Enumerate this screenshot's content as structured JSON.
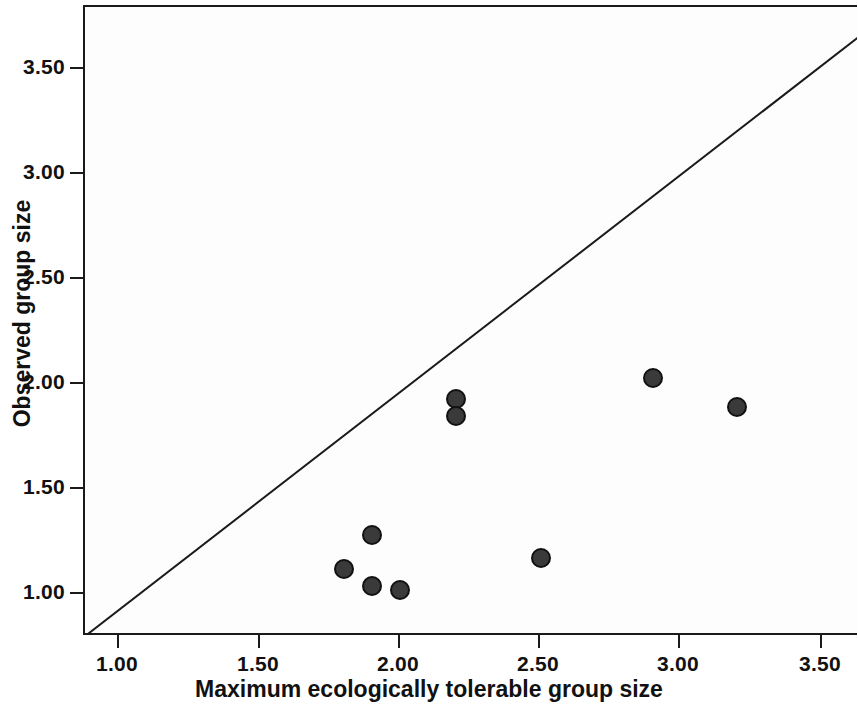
{
  "figure": {
    "background_color": "#ffffff",
    "plot_background_color": "#fdfdfd",
    "axis_color": "#1a1a1a",
    "marker_color": "#3a3a3a",
    "marker_edge_color": "#111111"
  },
  "chart_data": {
    "type": "scatter",
    "title": "",
    "xlabel": "Maximum ecologically tolerable group size",
    "ylabel": "Observed group size",
    "xlim": [
      0.88,
      3.63
    ],
    "ylim": [
      0.8,
      3.65
    ],
    "xticks": [
      1.0,
      1.5,
      2.0,
      2.5,
      3.0,
      3.5
    ],
    "xtick_labels": [
      "1.00",
      "1.50",
      "2.00",
      "2.50",
      "3.00",
      "3.50"
    ],
    "yticks": [
      1.0,
      1.5,
      2.0,
      2.5,
      3.0,
      3.5
    ],
    "ytick_labels": [
      "1.00",
      "1.50",
      "2.00",
      "2.50",
      "3.00",
      "3.50"
    ],
    "grid": false,
    "legend": null,
    "series": [
      {
        "name": "groups",
        "marker": "filled-circle",
        "marker_size_px": 20,
        "points": [
          {
            "x": 1.8,
            "y": 1.12
          },
          {
            "x": 1.9,
            "y": 1.28
          },
          {
            "x": 1.9,
            "y": 1.04
          },
          {
            "x": 2.0,
            "y": 1.02
          },
          {
            "x": 2.2,
            "y": 1.93
          },
          {
            "x": 2.2,
            "y": 1.85
          },
          {
            "x": 2.5,
            "y": 1.17
          },
          {
            "x": 2.9,
            "y": 2.03
          },
          {
            "x": 3.2,
            "y": 1.89
          }
        ]
      }
    ],
    "reference_line": {
      "name": "identity-line",
      "description": "y = x diagonal",
      "from": {
        "x": 0.88,
        "y": 0.8
      },
      "to": {
        "x": 3.63,
        "y": 3.65
      }
    }
  }
}
